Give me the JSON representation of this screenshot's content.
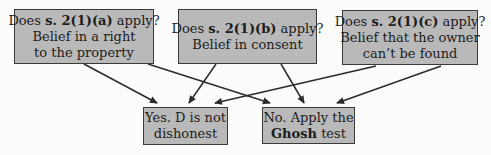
{
  "diagram": {
    "colors": {
      "box_fill": "#b9b9b9",
      "box_border": "#3a3a3a",
      "arrow": "#2b2b2b",
      "background": "#fbfbfa"
    },
    "boxes": {
      "q_a": {
        "l1_pre": "Does ",
        "l1_bold": "s. 2(1)(a)",
        "l1_post": " apply?",
        "l2": "Belief in a right",
        "l3": "to the property"
      },
      "q_b": {
        "l1_pre": "Does ",
        "l1_bold": "s. 2(1)(b)",
        "l1_post": " apply?",
        "l2": "Belief in consent"
      },
      "q_c": {
        "l1_pre": "Does ",
        "l1_bold": "s. 2(1)(c)",
        "l1_post": " apply?",
        "l2": "Belief that the owner",
        "l3": "can’t be found"
      },
      "yes": {
        "l1": "Yes. D is not",
        "l2": "dishonest"
      },
      "no": {
        "l1": "No. Apply the",
        "l2_bold": "Ghosh",
        "l2_post": " test"
      }
    },
    "edges": [
      {
        "from": "q_a",
        "to": "yes"
      },
      {
        "from": "q_a",
        "to": "no"
      },
      {
        "from": "q_b",
        "to": "yes"
      },
      {
        "from": "q_b",
        "to": "no"
      },
      {
        "from": "q_c",
        "to": "yes"
      },
      {
        "from": "q_c",
        "to": "no"
      }
    ]
  }
}
